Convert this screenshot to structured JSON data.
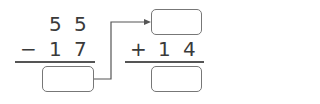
{
  "left_problem": {
    "top_digits": [
      "5",
      "5"
    ],
    "operator": "−",
    "bottom_digits": [
      "1",
      "7"
    ],
    "answer": ""
  },
  "right_problem": {
    "top_answer": "",
    "operator": "+",
    "bottom_digits": [
      "1",
      "4"
    ],
    "answer": ""
  },
  "colors": {
    "text": "#3a3a3a",
    "box_border": "#777777",
    "arrow": "#555555"
  }
}
